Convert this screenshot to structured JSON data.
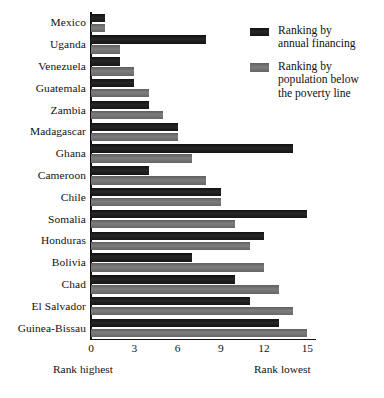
{
  "chart_data": {
    "type": "bar",
    "orientation": "horizontal",
    "title": "",
    "subtitle": "",
    "xlabel": "",
    "ylabel": "",
    "xlim": [
      0,
      15.6
    ],
    "xticks": [
      0,
      3,
      6,
      9,
      12,
      15
    ],
    "xtick_labels": [
      "0",
      "3",
      "6",
      "9",
      "12",
      "15"
    ],
    "grid": false,
    "legend_position": "top-right",
    "axis_captions": {
      "left": "Rank highest",
      "right": "Rank lowest"
    },
    "categories": [
      "Mexico",
      "Uganda",
      "Venezuela",
      "Guatemala",
      "Zambia",
      "Madagascar",
      "Ghana",
      "Cameroon",
      "Chile",
      "Somalia",
      "Honduras",
      "Bolivia",
      "Chad",
      "El Salvador",
      "Guinea-Bissau"
    ],
    "series": [
      {
        "name": "Ranking by annual financing",
        "color": "#1c1c1c",
        "values": [
          1,
          8,
          2,
          3,
          4,
          6,
          14,
          4,
          9,
          15,
          12,
          7,
          10,
          11,
          13
        ]
      },
      {
        "name": "Ranking by population below the poverty line",
        "color": "#6e6e6e",
        "values": [
          1,
          2,
          3,
          4,
          5,
          6,
          7,
          8,
          9,
          10,
          11,
          12,
          13,
          14,
          15
        ]
      }
    ]
  },
  "legend": {
    "items": [
      {
        "label_line1": "Ranking by",
        "label_line2": "annual financing",
        "label_line3": "",
        "swatch": "dark"
      },
      {
        "label_line1": "Ranking by",
        "label_line2": "population below",
        "label_line3": "the poverty line",
        "swatch": "gray"
      }
    ]
  }
}
